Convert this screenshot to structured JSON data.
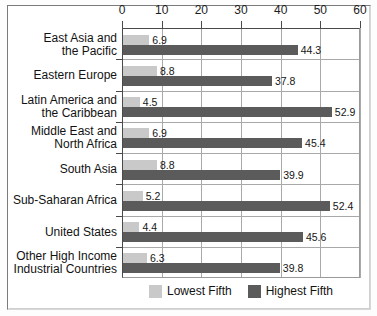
{
  "chart_data": {
    "type": "bar",
    "orientation": "horizontal",
    "title": "",
    "xlabel": "",
    "ylabel": "",
    "xlim": [
      0,
      60
    ],
    "xticks": [
      0,
      10,
      20,
      30,
      40,
      50,
      60
    ],
    "grid": true,
    "legend_position": "bottom-center",
    "categories": [
      "East Asia and\nthe Pacific",
      "Eastern Europe",
      "Latin America and\nthe Caribbean",
      "Middle East and\nNorth Africa",
      "South Asia",
      "Sub-Saharan Africa",
      "United States",
      "Other High Income\nIndustrial Countries"
    ],
    "series": [
      {
        "name": "Lowest Fifth",
        "color": "#c9c9c9",
        "values": [
          6.9,
          8.8,
          4.5,
          6.9,
          8.8,
          5.2,
          4.4,
          6.3
        ]
      },
      {
        "name": "Highest Fifth",
        "color": "#5b5b5b",
        "values": [
          44.3,
          37.8,
          52.9,
          45.4,
          39.9,
          52.4,
          45.6,
          39.8
        ]
      }
    ]
  },
  "legend": {
    "items": [
      {
        "label": "Lowest Fifth",
        "color": "#c9c9c9"
      },
      {
        "label": "Highest Fifth",
        "color": "#5b5b5b"
      }
    ]
  }
}
